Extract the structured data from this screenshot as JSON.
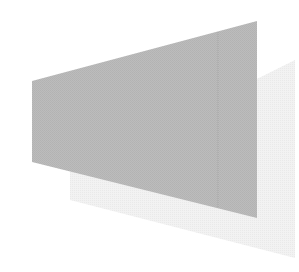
{
  "scene": {
    "background": "#ffffff",
    "shadow_shape": {
      "fill": "#ececec",
      "points": "70,175 295,62 295,255 70,200"
    },
    "main_trapezoid": {
      "fill": "#b9b9b9",
      "points": "32,81 257,21 257,218 32,162"
    },
    "seam_line": {
      "stroke": "#a9a9a9",
      "x": 218
    }
  }
}
